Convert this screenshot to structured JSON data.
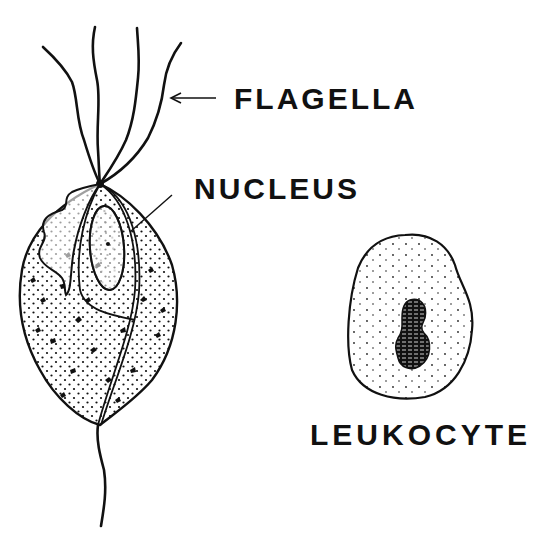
{
  "figure": {
    "type": "biological-illustration",
    "labels": {
      "flagella": "FLAGELLA",
      "nucleus": "NUCLEUS",
      "leukocyte": "LEUKOCYTE"
    },
    "parts": [
      {
        "name": "flagella",
        "count_anterior": 4,
        "pointer": "arrow"
      },
      {
        "name": "nucleus",
        "pointer": "line"
      },
      {
        "name": "undulating-membrane"
      },
      {
        "name": "axostyle"
      },
      {
        "name": "posterior-flagellum"
      },
      {
        "name": "leukocyte",
        "features": [
          "stippled cytoplasm",
          "dark lobed nucleus"
        ]
      }
    ],
    "colors": {
      "ink": "#111111",
      "background": "#ffffff"
    }
  }
}
